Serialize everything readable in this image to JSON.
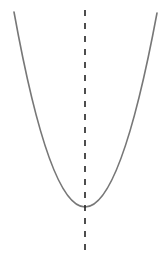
{
  "diagram": {
    "type": "parabola-with-axis-of-symmetry",
    "canvas": {
      "width": 160,
      "height": 271,
      "background": "#ffffff"
    },
    "parabola": {
      "orientation": "opens-up",
      "left_end": [
        14,
        12
      ],
      "right_end": [
        157,
        13
      ],
      "vertex": [
        85,
        207
      ],
      "stroke": "#777777",
      "stroke_width": 1.6
    },
    "axis_of_symmetry": {
      "x": 85,
      "y_start": 10,
      "y_end": 252,
      "stroke": "#222222",
      "stroke_width": 1.6,
      "dash": "6 7"
    }
  }
}
